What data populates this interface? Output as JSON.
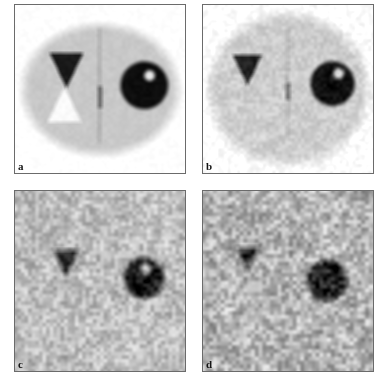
{
  "figure": {
    "background_color": "#ffffff",
    "layout": {
      "rows": 2,
      "cols": 2,
      "panel_count": 4
    },
    "modality": "grayscale",
    "colormap": "inverse-grayscale"
  },
  "panels": [
    {
      "id": "a",
      "label": "a",
      "position": "top-left",
      "noise_level": 0,
      "noise_label": "noiseless",
      "background_gray": "#f4f4f4",
      "body": {
        "shape": "ellipse",
        "fill_gray": "#c8c8c8",
        "cx_pct": 50,
        "cy_pct": 50,
        "rx_pct": 45,
        "ry_pct": 38,
        "edge_blur": 9
      },
      "features": [
        {
          "name": "cold-triangle",
          "shape": "inverted-triangle",
          "gray": "#1a1a1a",
          "cx_pct": 30,
          "cy_pct": 39,
          "size_pct": 20
        },
        {
          "name": "hot-triangle",
          "shape": "upright-triangle",
          "gray": "#fbfbfb",
          "cx_pct": 29,
          "cy_pct": 59,
          "size_pct": 20
        },
        {
          "name": "cold-sphere",
          "shape": "circle",
          "gray": "#0d0d0d",
          "cx_pct": 76,
          "cy_pct": 48,
          "r_pct": 14
        },
        {
          "name": "sphere-highlight",
          "shape": "circle",
          "gray": "#e8e8e8",
          "cx_pct": 79,
          "cy_pct": 42,
          "r_pct": 3
        },
        {
          "name": "midline-stripe",
          "shape": "vertical-line",
          "gray": "#9a9a9a",
          "cx_pct": 50,
          "y1_pct": 14,
          "y2_pct": 82,
          "w_pct": 1.2
        },
        {
          "name": "midline-dark-segment",
          "shape": "vertical-bar",
          "gray": "#5c5c5c",
          "cx_pct": 50,
          "cy_pct": 55,
          "w_pct": 2.2,
          "h_pct": 13
        }
      ]
    },
    {
      "id": "b",
      "label": "b",
      "position": "top-right",
      "noise_level": 1,
      "noise_label": "low noise",
      "background_gray": "#e2e2e2",
      "body": {
        "shape": "ellipse",
        "fill_gray": "#cdcdcd",
        "cx_pct": 50,
        "cy_pct": 50,
        "rx_pct": 46,
        "ry_pct": 44,
        "edge_blur": 13
      },
      "features": [
        {
          "name": "cold-triangle",
          "shape": "inverted-triangle",
          "gray": "#202020",
          "cx_pct": 26,
          "cy_pct": 39,
          "size_pct": 17
        },
        {
          "name": "cold-sphere",
          "shape": "circle",
          "gray": "#121212",
          "cx_pct": 76,
          "cy_pct": 47,
          "r_pct": 13
        },
        {
          "name": "sphere-highlight",
          "shape": "circle",
          "gray": "#dcdcdc",
          "cx_pct": 80,
          "cy_pct": 41,
          "r_pct": 3
        },
        {
          "name": "midline-stripe",
          "shape": "vertical-line",
          "gray": "#a8a8a8",
          "cx_pct": 50,
          "y1_pct": 14,
          "y2_pct": 80,
          "w_pct": 1.2
        },
        {
          "name": "midline-dark-segment",
          "shape": "vertical-bar",
          "gray": "#6a6a6a",
          "cx_pct": 50,
          "cy_pct": 52,
          "w_pct": 2.0,
          "h_pct": 10
        }
      ]
    },
    {
      "id": "c",
      "label": "c",
      "position": "bottom-left",
      "noise_level": 2,
      "noise_label": "medium noise",
      "background_gray": "#bdbdbd",
      "body": {
        "shape": "ellipse",
        "fill_gray": "#bdbdbd",
        "cx_pct": 50,
        "cy_pct": 50,
        "rx_pct": 52,
        "ry_pct": 50,
        "edge_blur": 18
      },
      "features": [
        {
          "name": "cold-triangle",
          "shape": "inverted-triangle",
          "gray": "#1e1e1e",
          "cx_pct": 30,
          "cy_pct": 40,
          "size_pct": 15
        },
        {
          "name": "cold-sphere",
          "shape": "circle",
          "gray": "#1c1c1c",
          "cx_pct": 76,
          "cy_pct": 48,
          "r_pct": 12
        },
        {
          "name": "sphere-highlight",
          "shape": "circle",
          "gray": "#cfcfcf",
          "cx_pct": 77,
          "cy_pct": 43,
          "r_pct": 3
        }
      ]
    },
    {
      "id": "d",
      "label": "d",
      "position": "bottom-right",
      "noise_level": 3,
      "noise_label": "high noise",
      "background_gray": "#b3b3b3",
      "body": {
        "shape": "ellipse",
        "fill_gray": "#b3b3b3",
        "cx_pct": 50,
        "cy_pct": 50,
        "rx_pct": 54,
        "ry_pct": 52,
        "edge_blur": 20
      },
      "features": [
        {
          "name": "cold-triangle",
          "shape": "inverted-triangle",
          "gray": "#303030",
          "cx_pct": 26,
          "cy_pct": 38,
          "size_pct": 14
        },
        {
          "name": "cold-sphere",
          "shape": "circle",
          "gray": "#2a2a2a",
          "cx_pct": 73,
          "cy_pct": 50,
          "r_pct": 12
        }
      ]
    }
  ]
}
